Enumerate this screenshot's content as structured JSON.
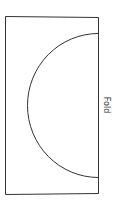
{
  "diagram": {
    "type": "pattern-template",
    "label": "Fold",
    "shape": "semicircle on folded rectangle",
    "colors": {
      "stroke": "#333333",
      "background": "#ffffff"
    }
  }
}
